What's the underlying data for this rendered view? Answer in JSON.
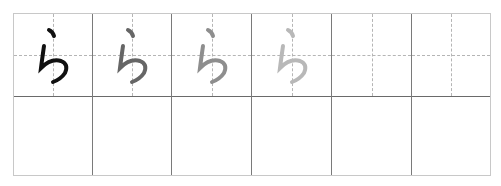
{
  "header": {
    "faint_text": ""
  },
  "worksheet": {
    "character": "ら",
    "columns": 6,
    "practice_row": [
      {
        "glyph": "ら",
        "color": "#111111"
      },
      {
        "glyph": "ら",
        "color": "#666666"
      },
      {
        "glyph": "ら",
        "color": "#8e8e8e"
      },
      {
        "glyph": "ら",
        "color": "#b8b8b8"
      },
      {
        "glyph": "",
        "color": ""
      },
      {
        "glyph": "",
        "color": ""
      }
    ],
    "blank_row": [
      {},
      {},
      {},
      {},
      {},
      {}
    ]
  }
}
